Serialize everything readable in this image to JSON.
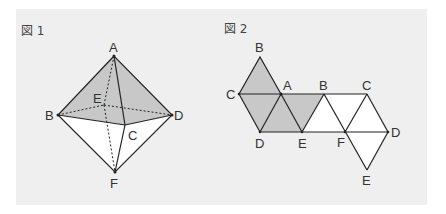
{
  "figures": [
    {
      "id": "fig1",
      "title": "図 1",
      "type": "octahedron",
      "vertices": {
        "A": [
          114,
          56
        ],
        "B": [
          58,
          115
        ],
        "C": [
          125,
          125
        ],
        "D": [
          172,
          115
        ],
        "E": [
          104,
          105
        ],
        "F": [
          115,
          172
        ]
      },
      "labels": {
        "A": "A",
        "B": "B",
        "C": "C",
        "D": "D",
        "E": "E",
        "F": "F"
      }
    },
    {
      "id": "fig2",
      "title": "図 2",
      "type": "net",
      "labels": {
        "B1": "B",
        "C1": "C",
        "A": "A",
        "B2": "B",
        "C2": "C",
        "D1": "D",
        "E1": "E",
        "F": "F",
        "D2": "D",
        "E2": "E"
      }
    }
  ],
  "colors": {
    "panel": "#efefef",
    "shade": "#c8c8c8",
    "line": "#222222",
    "face": "#ffffff"
  }
}
